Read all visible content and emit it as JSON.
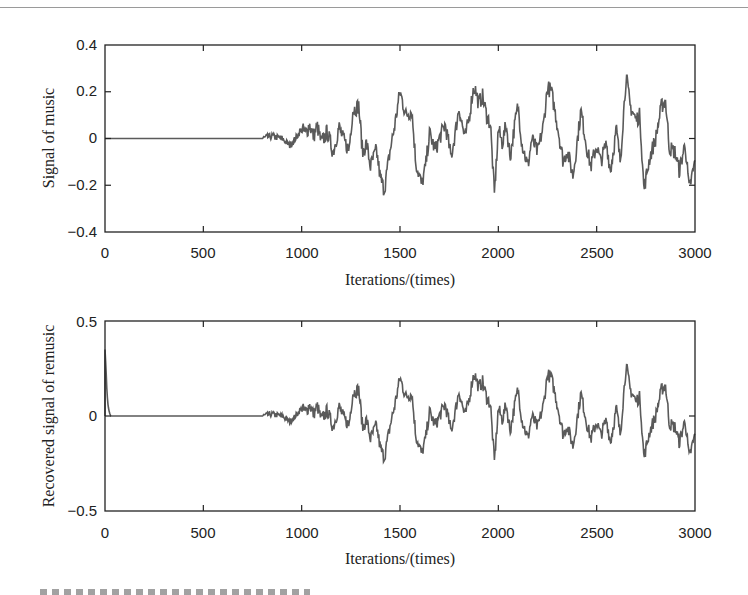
{
  "chart_data": [
    {
      "type": "line",
      "title": "",
      "xlabel": "Iterations/(times)",
      "ylabel": "Signal of music",
      "xlim": [
        0,
        3000
      ],
      "ylim": [
        -0.4,
        0.4
      ],
      "x_ticks": [
        "0",
        "500",
        "1000",
        "1500",
        "2000",
        "2500",
        "3000"
      ],
      "y_ticks": [
        "-0.4",
        "-0.2",
        "0",
        "0.2",
        "0.4"
      ],
      "grid": false,
      "line_color": "#555555",
      "series": [
        {
          "name": "music signal",
          "x": [
            0,
            800,
            850,
            900,
            940,
            960,
            1000,
            1020,
            1040,
            1060,
            1080,
            1100,
            1130,
            1160,
            1190,
            1210,
            1240,
            1260,
            1290,
            1310,
            1330,
            1350,
            1380,
            1400,
            1420,
            1450,
            1470,
            1500,
            1530,
            1560,
            1580,
            1610,
            1630,
            1650,
            1680,
            1700,
            1730,
            1760,
            1780,
            1800,
            1830,
            1850,
            1870,
            1880,
            1900,
            1920,
            1940,
            1960,
            1980,
            2000,
            2020,
            2040,
            2060,
            2080,
            2100,
            2120,
            2150,
            2170,
            2200,
            2230,
            2250,
            2270,
            2300,
            2330,
            2350,
            2380,
            2400,
            2420,
            2450,
            2470,
            2500,
            2520,
            2550,
            2570,
            2600,
            2620,
            2650,
            2670,
            2700,
            2720,
            2740,
            2770,
            2800,
            2830,
            2850,
            2870,
            2900,
            2920,
            2950,
            2970,
            3000
          ],
          "y": [
            0,
            0,
            0.01,
            0,
            -0.03,
            -0.01,
            0.04,
            0.02,
            0.06,
            0.01,
            0.05,
            -0.02,
            0.03,
            -0.06,
            0.05,
            0.0,
            -0.05,
            0.12,
            0.14,
            -0.06,
            -0.02,
            -0.12,
            -0.05,
            -0.17,
            -0.22,
            -0.05,
            0.04,
            0.2,
            0.1,
            0.12,
            -0.1,
            -0.2,
            -0.12,
            0.02,
            -0.05,
            0.0,
            0.06,
            -0.08,
            0.02,
            0.13,
            0.0,
            0.08,
            0.2,
            0.22,
            0.15,
            0.18,
            0.1,
            0.06,
            -0.24,
            0.04,
            -0.02,
            0.06,
            -0.08,
            0.04,
            0.14,
            -0.02,
            -0.12,
            0.0,
            -0.06,
            0.06,
            0.22,
            0.2,
            0.06,
            -0.1,
            -0.05,
            -0.16,
            -0.02,
            0.12,
            -0.04,
            -0.12,
            -0.03,
            -0.1,
            -0.02,
            -0.14,
            0.04,
            -0.1,
            0.27,
            0.14,
            0.08,
            0.1,
            -0.22,
            -0.08,
            0.0,
            0.14,
            0.16,
            -0.04,
            -0.06,
            -0.14,
            -0.02,
            -0.22,
            -0.1
          ]
        }
      ]
    },
    {
      "type": "line",
      "title": "",
      "xlabel": "Iterations/(times)",
      "ylabel": "Recovered signal of remusic",
      "xlim": [
        0,
        3000
      ],
      "ylim": [
        -0.5,
        0.5
      ],
      "x_ticks": [
        "0",
        "500",
        "1000",
        "1500",
        "2000",
        "2500",
        "3000"
      ],
      "y_ticks": [
        "-0.5",
        "0",
        "0.5"
      ],
      "grid": false,
      "line_color": "#555555",
      "series": [
        {
          "name": "recovered signal",
          "x": [
            0,
            5,
            10,
            15,
            20,
            25,
            30,
            40,
            800
          ],
          "y": [
            0.35,
            0.25,
            0.12,
            0.06,
            0.03,
            0.01,
            0.0,
            0.0,
            0.0
          ],
          "note": "after 800 iterations the recovered signal tracks the music signal (same shape as chart 1)"
        }
      ]
    }
  ],
  "plots": {
    "top": {
      "ylabel": "Signal of music",
      "xlabel": "Iterations/(times)",
      "yticks": [
        "0.4",
        "0.2",
        "0",
        "−0.2",
        "−0.4"
      ],
      "xticks": [
        "0",
        "500",
        "1000",
        "1500",
        "2000",
        "2500",
        "3000"
      ]
    },
    "bottom": {
      "ylabel": "Recovered signal of remusic",
      "xlabel": "Iterations/(times)",
      "yticks": [
        "0.5",
        "0",
        "−0.5"
      ],
      "xticks": [
        "0",
        "500",
        "1000",
        "1500",
        "2000",
        "2500",
        "3000"
      ]
    }
  }
}
